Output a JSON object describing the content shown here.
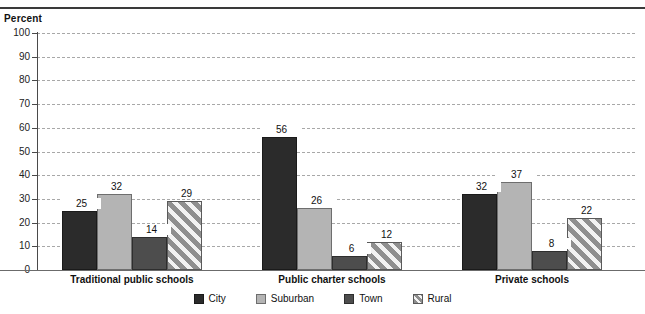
{
  "chart_data": {
    "type": "bar",
    "title": "",
    "subtitle": "",
    "ylabel": "Percent",
    "xlabel": "",
    "ylim": [
      0,
      100
    ],
    "ytick_step": 10,
    "yticks": [
      0,
      10,
      20,
      30,
      40,
      50,
      60,
      70,
      80,
      90,
      100
    ],
    "grid": true,
    "grid_style": "dashed-horizontal",
    "legend_position": "bottom-center",
    "categories": [
      "Traditional public schools",
      "Public charter schools",
      "Private schools"
    ],
    "series": [
      {
        "name": "City",
        "values": [
          25,
          56,
          32
        ],
        "color": "#2b2b2b",
        "pattern": "solid"
      },
      {
        "name": "Suburban",
        "values": [
          32,
          26,
          37
        ],
        "color": "#b4b4b4",
        "pattern": "solid"
      },
      {
        "name": "Town",
        "values": [
          14,
          6,
          8
        ],
        "color": "#4d4d4d",
        "pattern": "solid"
      },
      {
        "name": "Rural",
        "values": [
          29,
          12,
          22
        ],
        "color": "#8f8f8f",
        "pattern": "diagonal-hatch"
      }
    ],
    "data_labels": [
      [
        "25",
        "32",
        "14",
        "29"
      ],
      [
        "56",
        "26",
        "6",
        "12"
      ],
      [
        "32",
        "37",
        "8",
        "22"
      ]
    ]
  },
  "axis": {
    "title": "Percent",
    "tick_labels": [
      "100",
      "90",
      "80",
      "70",
      "60",
      "50",
      "40",
      "30",
      "20",
      "10",
      "0"
    ]
  },
  "groups": [
    {
      "label": "Traditional public schools"
    },
    {
      "label": "Public charter schools"
    },
    {
      "label": "Private schools"
    }
  ],
  "legend": {
    "items": [
      {
        "label": "City"
      },
      {
        "label": "Suburban"
      },
      {
        "label": "Town"
      },
      {
        "label": "Rural"
      }
    ]
  }
}
